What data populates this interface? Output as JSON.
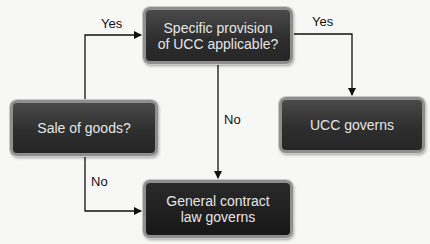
{
  "diagram": {
    "nodes": {
      "specific_provision": "Specific provision of UCC applicable?",
      "specific_provision_lines": [
        "Specific provision",
        "of UCC applicable?"
      ],
      "sale_of_goods": "Sale of goods?",
      "ucc_governs": "UCC governs",
      "general_contract_lines": [
        "General contract",
        "law governs"
      ]
    },
    "edges": {
      "sale_to_specific": "Yes",
      "specific_to_ucc": "Yes",
      "specific_to_general": "No",
      "sale_to_general": "No"
    },
    "colors": {
      "box_fill": "#2e2e2e",
      "box_border": "#8e8e8e",
      "box_text": "#e6e6e6",
      "line": "#111111",
      "background": "#f7f7f5"
    }
  }
}
